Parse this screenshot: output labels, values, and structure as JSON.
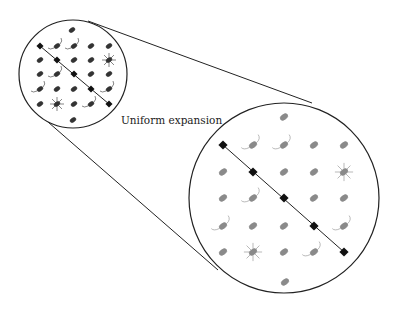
{
  "diagram": {
    "label": "Uniform expansion",
    "colors": {
      "stroke": "#222222",
      "galaxy_small": "#333333",
      "galaxy_large": "#8a8a8a",
      "marker": "#111111"
    },
    "small_view": {
      "circle": {
        "cx": 73,
        "cy": 74,
        "r": 54
      },
      "cols": [
        40,
        57,
        74,
        91,
        109
      ],
      "rows": [
        46,
        60,
        74,
        89,
        104
      ],
      "extra": [
        [
          72,
          30
        ],
        [
          73,
          120
        ]
      ],
      "scale": 1.0
    },
    "large_view": {
      "circle": {
        "cx": 284,
        "cy": 198,
        "r": 95
      },
      "cols": [
        223,
        253,
        284,
        314,
        344
      ],
      "rows": [
        145,
        172,
        198,
        226,
        252
      ],
      "extra": [
        [
          284,
          117
        ],
        [
          285,
          282
        ]
      ],
      "scale": 1.3
    },
    "tangent_lines": [
      {
        "x1": 88,
        "y1": 21,
        "x2": 312,
        "y2": 103
      },
      {
        "x1": 48,
        "y1": 122,
        "x2": 218,
        "y2": 270
      }
    ],
    "diagonal_markers": "row i, col i for i = 0..4",
    "special": {
      "stars": [
        [
          1,
          4
        ],
        [
          4,
          1
        ]
      ],
      "tails": [
        [
          0,
          1
        ],
        [
          0,
          2
        ],
        [
          2,
          1
        ],
        [
          3,
          0
        ],
        [
          3,
          4
        ],
        [
          4,
          3
        ]
      ]
    }
  }
}
